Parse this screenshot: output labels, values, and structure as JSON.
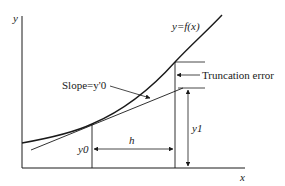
{
  "diagram": {
    "axes": {
      "x_label": "x",
      "y_label": "y"
    },
    "curve_label": "y=f(x)",
    "slope_label": "Slope=y'0",
    "truncation_label": "Truncation error",
    "step_label": "h",
    "y0_label": "y0",
    "y1_label": "y1",
    "colors": {
      "stroke": "#1a1a1a",
      "background": "#ffffff"
    }
  }
}
